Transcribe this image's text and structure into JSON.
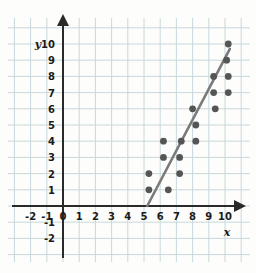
{
  "chart_data": {
    "type": "scatter",
    "title": "",
    "xlabel": "x",
    "ylabel": "y",
    "xlim": [
      -2.6,
      11.0
    ],
    "ylim": [
      -2.6,
      10.6
    ],
    "grid": true,
    "legend": "none",
    "x_ticks": [
      -2,
      -1,
      0,
      1,
      2,
      3,
      4,
      5,
      6,
      7,
      8,
      9,
      10
    ],
    "x_tick_labels": [
      "-2",
      "-1",
      "0",
      "1",
      "2",
      "3",
      "4",
      "5",
      "6",
      "7",
      "8",
      "9",
      "10"
    ],
    "y_ticks": [
      -2,
      -1,
      1,
      2,
      3,
      4,
      5,
      6,
      7,
      8,
      9,
      10
    ],
    "y_tick_labels": [
      "-2",
      "-1",
      "1",
      "2",
      "3",
      "4",
      "5",
      "6",
      "7",
      "8",
      "9",
      "10"
    ],
    "points": [
      {
        "x": 5.3,
        "y": 1
      },
      {
        "x": 5.3,
        "y": 2
      },
      {
        "x": 6.2,
        "y": 3
      },
      {
        "x": 6.2,
        "y": 4
      },
      {
        "x": 6.5,
        "y": 1
      },
      {
        "x": 7.2,
        "y": 2
      },
      {
        "x": 7.2,
        "y": 3
      },
      {
        "x": 7.3,
        "y": 4
      },
      {
        "x": 8.2,
        "y": 4
      },
      {
        "x": 8.2,
        "y": 5
      },
      {
        "x": 8.0,
        "y": 6
      },
      {
        "x": 9.4,
        "y": 6
      },
      {
        "x": 9.3,
        "y": 7
      },
      {
        "x": 9.3,
        "y": 8
      },
      {
        "x": 10.2,
        "y": 7
      },
      {
        "x": 10.2,
        "y": 8
      },
      {
        "x": 10.1,
        "y": 9
      },
      {
        "x": 10.2,
        "y": 10
      }
    ],
    "trend_line": {
      "name": "line of best fit",
      "x0": 5.2,
      "y0": 0,
      "x1": 10.3,
      "y1": 9.7
    },
    "colors": {
      "point": "#555555",
      "trend_line": "#7a7a7a",
      "axis": "#2a2a2a",
      "grid": "#c9d8dd",
      "background": "#fdfdfb",
      "label": "#1a1a1a"
    }
  }
}
